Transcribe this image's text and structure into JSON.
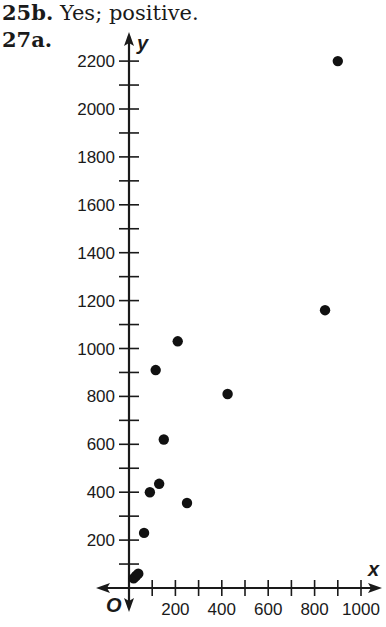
{
  "header": {
    "problem_25b_number": "25b.",
    "problem_25b_text": "Yes; positive.",
    "problem_27a_number": "27a."
  },
  "chart_data": {
    "type": "scatter",
    "title": "",
    "xlabel": "x",
    "ylabel": "y",
    "origin_label": "O",
    "xlim": [
      0,
      1000
    ],
    "ylim": [
      0,
      2200
    ],
    "grid": false,
    "x_ticks": [
      200,
      400,
      600,
      800,
      1000
    ],
    "x_minor_step": 100,
    "y_ticks": [
      200,
      400,
      600,
      800,
      1000,
      1200,
      1400,
      1600,
      1800,
      2000,
      2200
    ],
    "y_minor_step": 100,
    "points": [
      {
        "x": 20,
        "y": 40
      },
      {
        "x": 30,
        "y": 50
      },
      {
        "x": 40,
        "y": 60
      },
      {
        "x": 65,
        "y": 230
      },
      {
        "x": 90,
        "y": 400
      },
      {
        "x": 115,
        "y": 910
      },
      {
        "x": 130,
        "y": 435
      },
      {
        "x": 150,
        "y": 620
      },
      {
        "x": 210,
        "y": 1030
      },
      {
        "x": 250,
        "y": 355
      },
      {
        "x": 425,
        "y": 810
      },
      {
        "x": 845,
        "y": 1160
      },
      {
        "x": 900,
        "y": 2200
      }
    ],
    "point_color": "#111111",
    "axis_color": "#1a1a1a"
  }
}
